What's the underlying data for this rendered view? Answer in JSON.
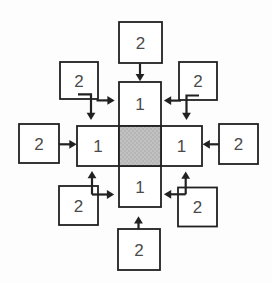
{
  "figure": {
    "colors": {
      "background": "#fdfdfd",
      "line": "#212121",
      "label": "#4a4a4a",
      "box_fill": "#ffffff",
      "center_base": "#b6b6b6",
      "center_dot": "#cfcfcf"
    },
    "inner_cells": {
      "top": {
        "label": "1"
      },
      "left": {
        "label": "1"
      },
      "right": {
        "label": "1"
      },
      "bottom": {
        "label": "1"
      }
    },
    "outer_boxes": {
      "top": {
        "label": "2"
      },
      "top_left": {
        "label": "2"
      },
      "top_right": {
        "label": "2"
      },
      "left": {
        "label": "2"
      },
      "right": {
        "label": "2"
      },
      "bottom_left": {
        "label": "2"
      },
      "bottom_right": {
        "label": "2"
      },
      "bottom": {
        "label": "2"
      }
    }
  }
}
